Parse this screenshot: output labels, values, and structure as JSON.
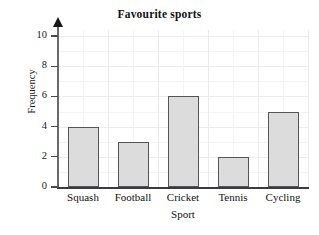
{
  "chart_data": {
    "type": "bar",
    "title": "Favourite sports",
    "xlabel": "Sport",
    "ylabel": "Frequency",
    "categories": [
      "Squash",
      "Football",
      "Cricket",
      "Tennis",
      "Cycling"
    ],
    "values": [
      4,
      3,
      6,
      2,
      5
    ],
    "ylim": [
      0,
      10
    ],
    "ytick_labels": [
      "0",
      "2",
      "4",
      "6",
      "8",
      "10"
    ],
    "ytick_values": [
      0,
      2,
      4,
      6,
      8,
      10
    ],
    "grid": true,
    "legend": null,
    "bar_fill_color": "#dcdcdc",
    "bar_edge_color": "#555558",
    "axis_color": "#3c3c40",
    "grid_color": "#ececed",
    "background_color": "#ffffff"
  }
}
